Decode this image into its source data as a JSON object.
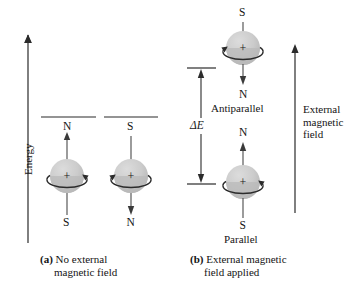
{
  "figure": {
    "axis_label": "Energy",
    "delta_label": "ΔE"
  },
  "panel_a": {
    "caption_tag": "(a)",
    "caption_line1": "No external",
    "caption_line2": "magnetic field",
    "spins": [
      {
        "name": "spin-up",
        "top_pole": "N",
        "bottom_pole": "S",
        "nucleus_charge": "+",
        "moment_direction": "up",
        "rotation_direction": "clockwise"
      },
      {
        "name": "spin-down",
        "top_pole": "S",
        "bottom_pole": "N",
        "nucleus_charge": "+",
        "moment_direction": "down",
        "rotation_direction": "counterclockwise"
      }
    ]
  },
  "panel_b": {
    "caption_tag": "(b)",
    "caption_line1": "External magnetic",
    "caption_line2": "field applied",
    "field_line1": "External",
    "field_line2": "magnetic",
    "field_line3": "field",
    "states": [
      {
        "name": "antiparallel-state",
        "state_label": "Antiparallel",
        "top_pole": "S",
        "bottom_pole": "N",
        "nucleus_charge": "+",
        "moment_direction": "down",
        "rotation_direction": "counterclockwise"
      },
      {
        "name": "parallel-state",
        "state_label": "Parallel",
        "top_pole": "N",
        "bottom_pole": "S",
        "nucleus_charge": "+",
        "moment_direction": "up",
        "rotation_direction": "clockwise"
      }
    ]
  },
  "colors": {
    "sphere_fill": "#c9c9c9",
    "sphere_shadow": "#a9a9a9",
    "sphere_highlight": "#d8d8d8",
    "stroke": "#2b2b2b",
    "text": "#141414",
    "background": "#ffffff"
  }
}
